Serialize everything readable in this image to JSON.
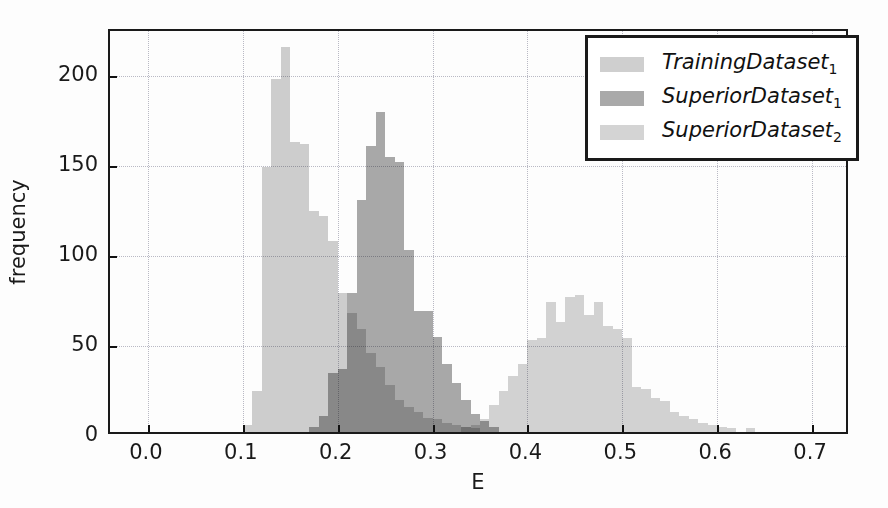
{
  "chart_data": {
    "type": "bar",
    "title": "",
    "subtitle": "",
    "xlabel": "E",
    "ylabel": "frequency",
    "xlim": [
      -0.04,
      0.74
    ],
    "ylim": [
      0,
      225
    ],
    "xticks": [
      "0.0",
      "0.1",
      "0.2",
      "0.3",
      "0.4",
      "0.5",
      "0.6",
      "0.7"
    ],
    "xtick_values": [
      0.0,
      0.1,
      0.2,
      0.3,
      0.4,
      0.5,
      0.6,
      0.7
    ],
    "yticks": [
      "0",
      "50",
      "100",
      "150",
      "200"
    ],
    "ytick_values": [
      0,
      50,
      100,
      150,
      200
    ],
    "grid": true,
    "legend_position": "top-right",
    "bin_width": 0.01,
    "overlap_mode": "alpha-blended overlapping histograms",
    "series": [
      {
        "name": "TrainingDataset1",
        "legend_label": "TrainingDataset",
        "legend_subscript": "1",
        "color": "#cfcfcf",
        "bins": [
          0.1,
          0.11,
          0.12,
          0.13,
          0.14,
          0.15,
          0.16,
          0.17,
          0.18,
          0.19,
          0.2,
          0.21,
          0.22,
          0.23,
          0.24,
          0.25,
          0.26,
          0.27,
          0.28,
          0.29,
          0.3,
          0.31,
          0.32,
          0.33,
          0.34
        ],
        "values": [
          4,
          23,
          147,
          196,
          214,
          161,
          160,
          123,
          120,
          106,
          77,
          66,
          57,
          44,
          36,
          26,
          18,
          14,
          11,
          8,
          7,
          5,
          4,
          3,
          2
        ]
      },
      {
        "name": "SuperiorDataset1",
        "legend_label": "SuperiorDataset",
        "legend_subscript": "1",
        "color": "#a9a9a9",
        "bins": [
          0.17,
          0.18,
          0.19,
          0.2,
          0.21,
          0.22,
          0.23,
          0.24,
          0.25,
          0.26,
          0.27,
          0.28,
          0.29,
          0.3,
          0.31,
          0.32,
          0.33,
          0.34,
          0.35,
          0.36
        ],
        "values": [
          3,
          9,
          33,
          35,
          77,
          129,
          159,
          178,
          153,
          150,
          101,
          67,
          67,
          53,
          38,
          27,
          18,
          10,
          6,
          3
        ]
      },
      {
        "name": "SuperiorDataset2",
        "legend_label": "SuperiorDataset",
        "legend_subscript": "2",
        "color": "#d4d4d4",
        "bins": [
          0.33,
          0.34,
          0.35,
          0.36,
          0.37,
          0.38,
          0.39,
          0.4,
          0.41,
          0.42,
          0.43,
          0.44,
          0.45,
          0.46,
          0.47,
          0.48,
          0.49,
          0.5,
          0.51,
          0.52,
          0.53,
          0.54,
          0.55,
          0.56,
          0.57,
          0.58,
          0.59,
          0.6,
          0.61,
          0.63
        ],
        "values": [
          3,
          4,
          7,
          15,
          23,
          31,
          38,
          51,
          52,
          72,
          61,
          75,
          76,
          65,
          72,
          59,
          57,
          52,
          25,
          24,
          19,
          17,
          11,
          9,
          7,
          5,
          4,
          3,
          2,
          2
        ]
      }
    ]
  }
}
